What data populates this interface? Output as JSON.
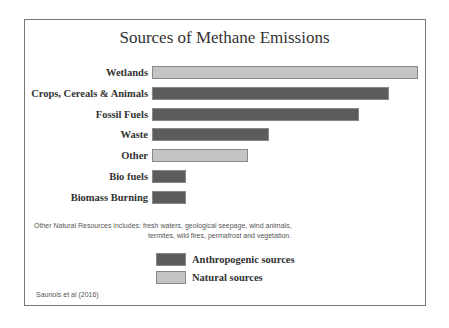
{
  "chart_data": {
    "type": "bar",
    "orientation": "horizontal",
    "title": "Sources of Methane Emissions",
    "categories": [
      "Wetlands",
      "Crops, Cereals & Animals",
      "Fossil Fuels",
      "Waste",
      "Other",
      "Bio fuels",
      "Biomass Burning"
    ],
    "values": [
      266,
      237,
      207,
      117,
      96,
      34,
      34
    ],
    "source_type": [
      "Natural",
      "Anthropogenic",
      "Anthropogenic",
      "Anthropogenic",
      "Natural",
      "Anthropogenic",
      "Anthropogenic"
    ],
    "xlabel": "",
    "ylabel": "",
    "grid": false,
    "legend": [
      {
        "label": "Anthropogenic sources",
        "color": "#5c5c5c"
      },
      {
        "label": "Natural sources",
        "color": "#c4c4c4"
      }
    ],
    "legend_position": "bottom"
  },
  "title": "Sources of Methane Emissions",
  "labels": [
    "Wetlands",
    "Crops, Cereals & Animals",
    "Fossil Fuels",
    "Waste",
    "Other",
    "Bio fuels",
    "Biomass Burning"
  ],
  "note_line1": "Other Natural Resources includes:  fresh waters, geological seepage, wind animals,",
  "note_line2": "termites, wild fires, permafrost and vegetation.",
  "legend": {
    "anthro": "Anthropogenic sources",
    "natural": "Natural sources"
  },
  "source": "Saunois et al (2016)",
  "colors": {
    "anthro": "#5c5c5c",
    "natural": "#c4c4c4"
  }
}
